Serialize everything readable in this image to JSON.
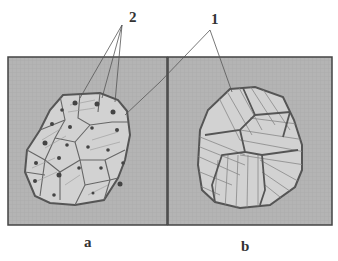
{
  "callouts": {
    "label_2": "2",
    "label_1": "1"
  },
  "panels": [
    {
      "id": "a",
      "caption": "a",
      "description": "cells with nuclei"
    },
    {
      "id": "b",
      "caption": "b",
      "description": "striated grains without nuclei"
    }
  ],
  "colors": {
    "background": "#b4b4b4",
    "grain_fill": "#d2d2d2",
    "outline": "#555555"
  }
}
